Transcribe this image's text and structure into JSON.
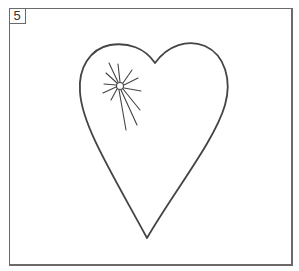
{
  "panel": {
    "number": "5",
    "subject": "heart-with-sparkle"
  },
  "colors": {
    "line": "#444444",
    "frame": "#6a6a6a",
    "background": "#ffffff"
  }
}
